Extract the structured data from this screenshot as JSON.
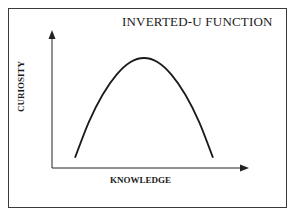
{
  "chart_data": {
    "type": "line",
    "title": "INVERTED-U FUNCTION",
    "xlabel": "KNOWLEDGE",
    "ylabel": "CURIOSITY",
    "grid": false,
    "legend": "none",
    "x": [
      0.0,
      0.1,
      0.2,
      0.3,
      0.4,
      0.5,
      0.6,
      0.7,
      0.8,
      0.9,
      1.0
    ],
    "series": [
      {
        "name": "curiosity",
        "values": [
          0.05,
          0.39,
          0.65,
          0.84,
          0.96,
          1.0,
          0.96,
          0.84,
          0.65,
          0.39,
          0.05
        ]
      }
    ],
    "xlim": [
      0,
      1
    ],
    "ylim": [
      0,
      1
    ]
  }
}
